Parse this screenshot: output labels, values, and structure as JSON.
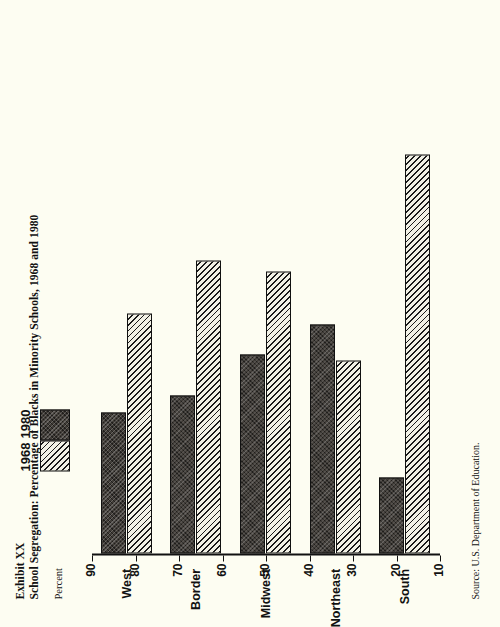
{
  "exhibit": {
    "label": "Exhibit XX",
    "title": "School Segregation: Percentage of Blacks in Minority Schools, 1968 and 1980",
    "source": "Source:  U.S. Department of Education."
  },
  "legend": {
    "items": [
      {
        "label": "1968",
        "pattern": "diagonal-hatch"
      },
      {
        "label": "1980",
        "pattern": "dark-stipple"
      }
    ]
  },
  "chart_data": {
    "type": "bar",
    "orientation": "horizontal",
    "title": "School Segregation: Percentage of Blacks in Minority Schools, 1968 and 1980",
    "xlabel": "Percent",
    "ylabel": "",
    "categories": [
      "South",
      "Northeast",
      "Midwest",
      "Border",
      "West"
    ],
    "series": [
      {
        "name": "1968",
        "values": [
          78,
          43,
          58,
          60,
          51
        ]
      },
      {
        "name": "1980",
        "values": [
          23,
          49,
          44,
          37,
          34
        ]
      }
    ],
    "xlim": [
      10,
      90
    ],
    "ticks": [
      90,
      80,
      70,
      60,
      50,
      40,
      30,
      20,
      10
    ],
    "tick_labels": [
      "90",
      "80",
      "70",
      "60",
      "50",
      "40",
      "30",
      "20",
      "10"
    ],
    "grid": false,
    "legend_position": "top"
  }
}
